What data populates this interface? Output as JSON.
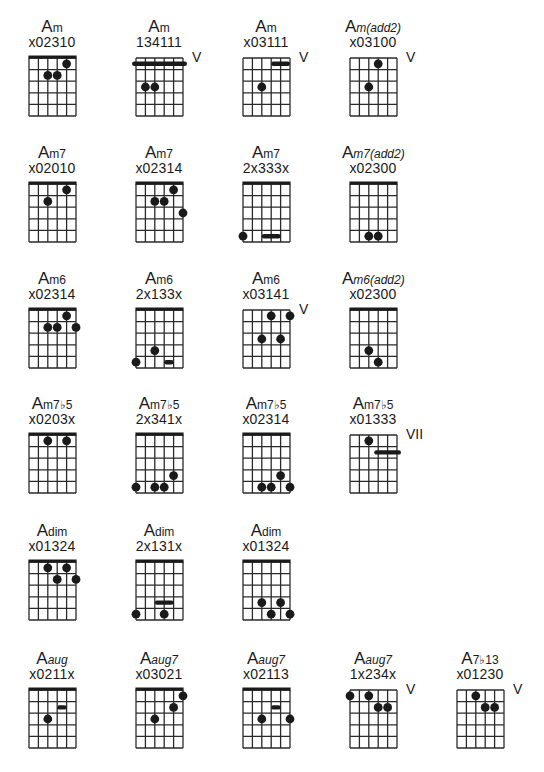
{
  "chords": [
    {
      "row": 0,
      "col": 0,
      "base": "A",
      "suffix": "m",
      "italic_suffix": false,
      "fingering": "x02310",
      "nut": true,
      "position": "",
      "dots": [
        [
          3,
          2
        ],
        [
          4,
          2
        ],
        [
          5,
          1
        ]
      ],
      "barres": []
    },
    {
      "row": 0,
      "col": 1,
      "base": "A",
      "suffix": "m",
      "italic_suffix": false,
      "fingering": "134111",
      "nut": false,
      "position": "V",
      "dots": [
        [
          2,
          3
        ],
        [
          3,
          3
        ]
      ],
      "barres": [
        [
          1,
          6,
          1,
          true
        ]
      ]
    },
    {
      "row": 0,
      "col": 2,
      "base": "A",
      "suffix": "m",
      "italic_suffix": false,
      "fingering": "x03111",
      "nut": false,
      "position": "V",
      "dots": [
        [
          3,
          3
        ]
      ],
      "barres": [
        [
          4,
          6,
          1,
          false
        ]
      ]
    },
    {
      "row": 0,
      "col": 3,
      "base": "A",
      "suffix": "m(add2)",
      "italic_suffix": true,
      "fingering": "x03100",
      "nut": false,
      "position": "V",
      "dots": [
        [
          4,
          1
        ],
        [
          3,
          3
        ]
      ],
      "barres": []
    },
    {
      "row": 1,
      "col": 0,
      "base": "A",
      "suffix": "m7",
      "italic_suffix": false,
      "fingering": "x02010",
      "nut": true,
      "position": "",
      "dots": [
        [
          5,
          1
        ],
        [
          3,
          2
        ]
      ],
      "barres": []
    },
    {
      "row": 1,
      "col": 1,
      "base": "A",
      "suffix": "m7",
      "italic_suffix": false,
      "fingering": "x02314",
      "nut": true,
      "position": "",
      "dots": [
        [
          5,
          1
        ],
        [
          3,
          2
        ],
        [
          4,
          2
        ],
        [
          6,
          3
        ]
      ],
      "barres": []
    },
    {
      "row": 1,
      "col": 2,
      "base": "A",
      "suffix": "m7",
      "italic_suffix": false,
      "fingering": "2x333x",
      "nut": true,
      "position": "",
      "dots": [
        [
          1,
          5
        ]
      ],
      "barres": [
        [
          3,
          5,
          5,
          false
        ]
      ]
    },
    {
      "row": 1,
      "col": 3,
      "base": "A",
      "suffix": "m7(add2)",
      "italic_suffix": true,
      "fingering": "x02300",
      "nut": true,
      "position": "",
      "dots": [
        [
          3,
          5
        ],
        [
          4,
          5
        ]
      ],
      "barres": []
    },
    {
      "row": 2,
      "col": 0,
      "base": "A",
      "suffix": "m6",
      "italic_suffix": false,
      "fingering": "x02314",
      "nut": true,
      "position": "",
      "dots": [
        [
          5,
          1
        ],
        [
          3,
          2
        ],
        [
          4,
          2
        ],
        [
          6,
          2
        ]
      ],
      "barres": []
    },
    {
      "row": 2,
      "col": 1,
      "base": "A",
      "suffix": "m6",
      "italic_suffix": false,
      "fingering": "2x133x",
      "nut": true,
      "position": "",
      "dots": [
        [
          3,
          4
        ],
        [
          1,
          5
        ]
      ],
      "barres": [
        [
          4,
          5,
          5,
          false
        ]
      ]
    },
    {
      "row": 2,
      "col": 2,
      "base": "A",
      "suffix": "m6",
      "italic_suffix": false,
      "fingering": "x03141",
      "nut": false,
      "position": "V",
      "dots": [
        [
          4,
          1
        ],
        [
          6,
          1
        ],
        [
          3,
          3
        ],
        [
          5,
          3
        ]
      ],
      "barres": []
    },
    {
      "row": 2,
      "col": 3,
      "base": "A",
      "suffix": "m6(add2)",
      "italic_suffix": true,
      "fingering": "x02300",
      "nut": true,
      "position": "",
      "dots": [
        [
          3,
          4
        ],
        [
          4,
          5
        ]
      ],
      "barres": []
    },
    {
      "row": 3,
      "col": 0,
      "base": "A",
      "suffix": "m7♭5",
      "italic_suffix": false,
      "fingering": "x0203x",
      "nut": true,
      "position": "",
      "dots": [
        [
          3,
          1
        ],
        [
          5,
          1
        ]
      ],
      "barres": []
    },
    {
      "row": 3,
      "col": 1,
      "base": "A",
      "suffix": "m7♭5",
      "italic_suffix": false,
      "fingering": "2x341x",
      "nut": true,
      "position": "",
      "dots": [
        [
          5,
          4
        ],
        [
          1,
          5
        ],
        [
          3,
          5
        ],
        [
          4,
          5
        ]
      ],
      "barres": []
    },
    {
      "row": 3,
      "col": 2,
      "base": "A",
      "suffix": "m7♭5",
      "italic_suffix": false,
      "fingering": "x02314",
      "nut": true,
      "position": "",
      "dots": [
        [
          5,
          4
        ],
        [
          3,
          5
        ],
        [
          4,
          5
        ],
        [
          6,
          5
        ]
      ],
      "barres": []
    },
    {
      "row": 3,
      "col": 3,
      "base": "A",
      "suffix": "m7♭5",
      "italic_suffix": false,
      "fingering": "x01333",
      "nut": false,
      "position": "VII",
      "dots": [
        [
          3,
          1
        ]
      ],
      "barres": [
        [
          4,
          6,
          2,
          true
        ]
      ]
    },
    {
      "row": 4,
      "col": 0,
      "base": "A",
      "suffix": "dim",
      "italic_suffix": false,
      "fingering": "x01324",
      "nut": true,
      "position": "",
      "dots": [
        [
          3,
          1
        ],
        [
          5,
          1
        ],
        [
          4,
          2
        ],
        [
          6,
          2
        ]
      ],
      "barres": []
    },
    {
      "row": 4,
      "col": 1,
      "base": "A",
      "suffix": "dim",
      "italic_suffix": false,
      "fingering": "2x131x",
      "nut": true,
      "position": "",
      "dots": [
        [
          1,
          5
        ],
        [
          4,
          5
        ]
      ],
      "barres": [
        [
          3,
          5,
          4,
          false
        ]
      ]
    },
    {
      "row": 4,
      "col": 2,
      "base": "A",
      "suffix": "dim",
      "italic_suffix": false,
      "fingering": "x01324",
      "nut": true,
      "position": "",
      "dots": [
        [
          3,
          4
        ],
        [
          5,
          4
        ],
        [
          4,
          5
        ],
        [
          6,
          5
        ]
      ],
      "barres": []
    },
    {
      "row": 5,
      "col": 0,
      "base": "A",
      "suffix": "aug",
      "italic_suffix": true,
      "fingering": "x0211x",
      "nut": true,
      "position": "",
      "dots": [
        [
          3,
          3
        ]
      ],
      "barres": [
        [
          4,
          5,
          2,
          false
        ]
      ]
    },
    {
      "row": 5,
      "col": 1,
      "base": "A",
      "suffix": "aug7",
      "italic_suffix": true,
      "fingering": "x03021",
      "nut": true,
      "position": "",
      "dots": [
        [
          6,
          1
        ],
        [
          5,
          2
        ],
        [
          3,
          3
        ]
      ],
      "barres": []
    },
    {
      "row": 5,
      "col": 2,
      "base": "A",
      "suffix": "aug7",
      "italic_suffix": true,
      "fingering": "x02113",
      "nut": true,
      "position": "",
      "dots": [
        [
          3,
          3
        ],
        [
          6,
          3
        ]
      ],
      "barres": [
        [
          4,
          5,
          2,
          false
        ]
      ]
    },
    {
      "row": 5,
      "col": 3,
      "base": "A",
      "suffix": "aug7",
      "italic_suffix": true,
      "fingering": "1x234x",
      "nut": false,
      "position": "V",
      "dots": [
        [
          1,
          1
        ],
        [
          3,
          1
        ],
        [
          4,
          2
        ],
        [
          5,
          2
        ]
      ],
      "barres": []
    },
    {
      "row": 5,
      "col": 4,
      "base": "A",
      "suffix": "7♭13",
      "italic_suffix": false,
      "fingering": "x01230",
      "nut": false,
      "position": "V",
      "dots": [
        [
          3,
          1
        ],
        [
          4,
          2
        ],
        [
          5,
          2
        ]
      ],
      "barres": []
    }
  ]
}
